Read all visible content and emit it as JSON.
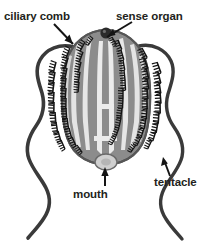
{
  "figure": {
    "organism": "comb jelly",
    "background_color": "#ffffff",
    "body_outline_color": "#5a5a5a",
    "body_fill_color": "#8c8c8c",
    "canal_color": "#ebebeb",
    "comb_color": "#1a1a1a",
    "tentacle_color": "#3a3a3a",
    "sense_organ_color": "#2b2b2b",
    "mouth_color": "#cfcfcf",
    "label_color": "#231f20"
  },
  "labels": [
    {
      "id": "ciliary-comb",
      "text": "ciliary comb",
      "arrow": "points down-right to comb row on upper left of body"
    },
    {
      "id": "sense-organ",
      "text": "sense organ",
      "arrow": "points down-left to dark circle at apex of body"
    },
    {
      "id": "mouth",
      "text": "mouth",
      "arrow": "points up to rounded lobe at base of body"
    },
    {
      "id": "tentacle",
      "text": "tentacle",
      "arrow": "points up-left to right wavy tentacle"
    }
  ],
  "parts": {
    "body": "ovoid striped body",
    "comb_rows_count": 8,
    "tentacles_count": 2,
    "sense_organ": "statocyst at apical organ",
    "mouth": "oral opening at base"
  }
}
